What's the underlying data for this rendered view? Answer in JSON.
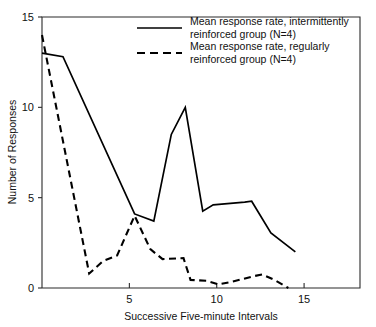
{
  "chart_data": {
    "type": "line",
    "title": "",
    "xlabel": "Successive Five-minute Intervals",
    "ylabel": "Number of Responses",
    "xlim": [
      0,
      18.2
    ],
    "ylim": [
      0,
      15
    ],
    "xticks": [
      5,
      10,
      15
    ],
    "xtick_labels": [
      "5",
      "10",
      "15"
    ],
    "yticks": [
      0,
      5,
      10,
      15
    ],
    "ytick_labels": [
      "0",
      "5",
      "10",
      "15"
    ],
    "grid": false,
    "legend_position": "top-right-inside",
    "series": [
      {
        "name": "Mean response rate, intermittently reinforced group (N=4)",
        "style": "solid",
        "color": "#000000",
        "x": [
          0.0,
          1.2,
          5.3,
          6.4,
          7.4,
          8.2,
          9.2,
          9.8,
          11.6,
          12.0,
          13.1,
          14.5
        ],
        "y": [
          13.0,
          12.8,
          4.1,
          3.7,
          8.5,
          10.0,
          4.25,
          4.6,
          4.75,
          4.8,
          3.05,
          2.0
        ]
      },
      {
        "name": "Mean response rate, regularly reinforced group (N=4)",
        "style": "dashed",
        "color": "#000000",
        "x": [
          0.0,
          2.7,
          3.5,
          4.3,
          5.3,
          6.2,
          6.9,
          8.1,
          8.5,
          9.4,
          10.1,
          10.9,
          12.1,
          12.6,
          13.3,
          14.1
        ],
        "y": [
          14.0,
          0.8,
          1.5,
          1.8,
          4.0,
          2.15,
          1.6,
          1.65,
          0.45,
          0.4,
          0.2,
          0.35,
          0.65,
          0.75,
          0.45,
          0.0
        ]
      }
    ]
  },
  "legend": {
    "entries": [
      {
        "line1": "Mean response rate, intermittently",
        "line2": "reinforced group (N=4)",
        "style": "solid"
      },
      {
        "line1": "Mean response rate, regularly",
        "line2": "reinforced group (N=4)",
        "style": "dashed"
      }
    ]
  },
  "axes": {
    "x_title": "Successive Five-minute Intervals",
    "y_title": "Number of Responses",
    "x_tick_labels": [
      "5",
      "10",
      "15"
    ],
    "y_tick_labels": [
      "0",
      "5",
      "10",
      "15"
    ]
  },
  "colors": {
    "background": "#ffffff",
    "axis": "#2b2b2b",
    "ink": "#000000",
    "text": "#111111"
  }
}
